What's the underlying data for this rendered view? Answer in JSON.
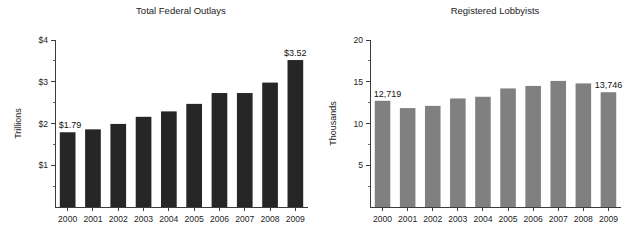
{
  "figure": {
    "width": 633,
    "height": 247,
    "background": "#ffffff"
  },
  "chart_data": [
    {
      "id": "total-federal-outlays",
      "type": "bar",
      "title": "Total Federal Outlays",
      "xlabel": "",
      "ylabel": "Trillions",
      "categories": [
        "2000",
        "2001",
        "2002",
        "2003",
        "2004",
        "2005",
        "2006",
        "2007",
        "2008",
        "2009"
      ],
      "values": [
        1.79,
        1.86,
        1.99,
        2.16,
        2.29,
        2.47,
        2.73,
        2.73,
        2.98,
        3.52
      ],
      "ylim": [
        0,
        4
      ],
      "yticks": [
        1,
        2,
        3,
        4
      ],
      "ytick_labels": [
        "$1",
        "$2",
        "$3",
        "$4"
      ],
      "yminor_ticks": [
        0.5,
        1.5,
        2.5,
        3.5
      ],
      "grid": false,
      "legend": "none",
      "bar_color": "#262626",
      "annotations": [
        {
          "category": "2000",
          "text": "$1.79"
        },
        {
          "category": "2009",
          "text": "$3.52"
        }
      ]
    },
    {
      "id": "registered-lobbyists",
      "type": "bar",
      "title": "Registered Lobbyists",
      "xlabel": "",
      "ylabel": "Thousands",
      "categories": [
        "2000",
        "2001",
        "2002",
        "2003",
        "2004",
        "2005",
        "2006",
        "2007",
        "2008",
        "2009"
      ],
      "values": [
        12.719,
        11.845,
        12.113,
        13.0,
        13.2,
        14.2,
        14.5,
        15.1,
        14.8,
        13.746
      ],
      "ylim": [
        0,
        20
      ],
      "yticks": [
        5,
        10,
        15,
        20
      ],
      "ytick_labels": [
        "5",
        "10",
        "15",
        "20"
      ],
      "yminor_ticks": [
        2.5,
        7.5,
        12.5,
        17.5
      ],
      "grid": false,
      "legend": "none",
      "bar_color": "#808080",
      "annotations": [
        {
          "category": "2000",
          "text": "12,719"
        },
        {
          "category": "2009",
          "text": "13,746"
        }
      ]
    }
  ]
}
